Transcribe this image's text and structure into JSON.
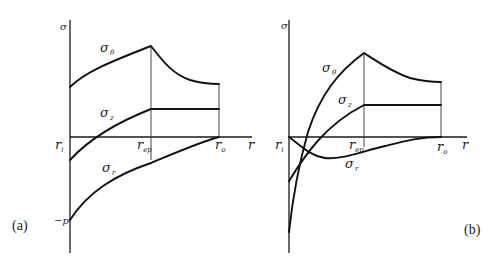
{
  "figure": {
    "panels": [
      {
        "id": "a",
        "panel_label": "(a)",
        "y_axis_label": "σ",
        "x_axis_label": "r",
        "tick_labels": {
          "ri": "r",
          "ri_sub": "i",
          "rep": "r",
          "rep_sub": "ep",
          "ro": "r",
          "ro_sub": "o"
        },
        "y_value_label": "−p",
        "curves": [
          {
            "name": "sigma-theta",
            "symbol": "σ",
            "subscript": "θ"
          },
          {
            "name": "sigma-z",
            "symbol": "σ",
            "subscript": "z"
          },
          {
            "name": "sigma-r",
            "symbol": "σ",
            "subscript": "r"
          }
        ]
      },
      {
        "id": "b",
        "panel_label": "(b)",
        "y_axis_label": "σ",
        "x_axis_label": "r",
        "tick_labels": {
          "ri": "r",
          "ri_sub": "i",
          "rep": "r",
          "rep_sub": "ep",
          "ro": "r",
          "ro_sub": "o"
        },
        "curves": [
          {
            "name": "sigma-theta",
            "symbol": "σ",
            "subscript": "θ"
          },
          {
            "name": "sigma-z",
            "symbol": "σ",
            "subscript": "z"
          },
          {
            "name": "sigma-r",
            "symbol": "σ",
            "subscript": "r"
          }
        ]
      }
    ]
  }
}
